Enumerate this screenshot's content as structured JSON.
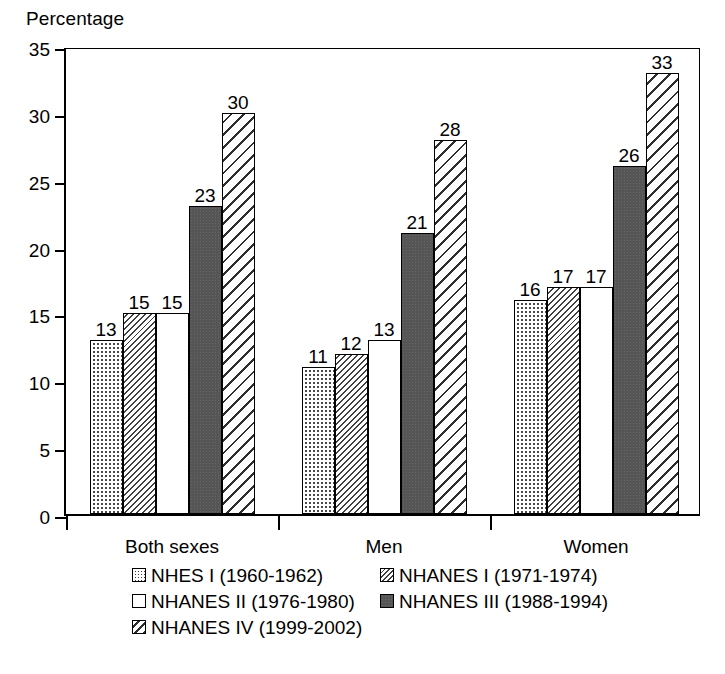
{
  "chart_data": {
    "type": "bar",
    "title": "",
    "ylabel": "Percentage",
    "xlabel": "",
    "ylim": [
      0,
      35
    ],
    "yticks": [
      0,
      5,
      10,
      15,
      20,
      25,
      30,
      35
    ],
    "grid": false,
    "legend_position": "bottom",
    "categories": [
      "Both sexes",
      "Men",
      "Women"
    ],
    "series": [
      {
        "name": "NHES I (1960-1962)",
        "pattern": "dots",
        "values": [
          13,
          11,
          16
        ]
      },
      {
        "name": "NHANES I (1971-1974)",
        "pattern": "hatch-fine",
        "values": [
          15,
          12,
          17
        ]
      },
      {
        "name": "NHANES II (1976-1980)",
        "pattern": "empty",
        "values": [
          15,
          13,
          17
        ]
      },
      {
        "name": "NHANES III (1988-1994)",
        "pattern": "solid",
        "values": [
          23,
          21,
          26
        ]
      },
      {
        "name": "NHANES IV (1999-2002)",
        "pattern": "hatch-wide",
        "values": [
          30,
          28,
          33
        ]
      }
    ],
    "bar_labels": [
      [
        "13",
        "15",
        "15",
        "23",
        "30"
      ],
      [
        "11",
        "12",
        "13",
        "21",
        "28"
      ],
      [
        "16",
        "17",
        "17",
        "26",
        "33"
      ]
    ],
    "colors": {
      "axis": "#000000",
      "bar_outline": "#000000",
      "solid_fill": "#555555",
      "hatch_fill": "#2d2d2d",
      "background": "#ffffff"
    }
  },
  "axis": {
    "y_title": "Percentage",
    "tick_labels": [
      "35",
      "30",
      "25",
      "20",
      "15",
      "10",
      "5",
      "0"
    ],
    "category_labels": [
      "Both sexes",
      "Men",
      "Women"
    ]
  },
  "legend": {
    "rows": [
      [
        {
          "label": "NHES I (1960-1962)",
          "pattern": "dots"
        },
        {
          "label": "NHANES I (1971-1974)",
          "pattern": "hatch-fine"
        }
      ],
      [
        {
          "label": "NHANES II (1976-1980)",
          "pattern": "empty"
        },
        {
          "label": "NHANES III (1988-1994)",
          "pattern": "solid"
        }
      ],
      [
        {
          "label": "NHANES IV (1999-2002)",
          "pattern": "hatch-wide"
        }
      ]
    ]
  }
}
